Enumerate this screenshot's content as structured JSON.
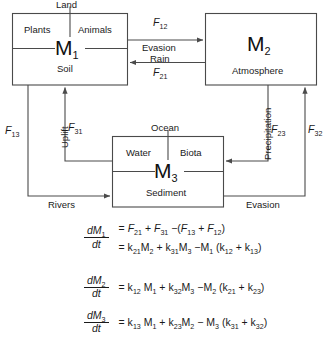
{
  "diagram": {
    "colors": {
      "stroke": "#4a4a4a",
      "text": "#1a1a1a",
      "background": "#ffffff"
    },
    "boxes": [
      {
        "id": "m1",
        "symbol": "M",
        "subscript": "1",
        "header": "Land",
        "upper_left": "Plants",
        "upper_right": "Animals",
        "lower": "Soil"
      },
      {
        "id": "m2",
        "symbol": "M",
        "subscript": "2",
        "header": "",
        "lower": "Atmosphere"
      },
      {
        "id": "m3",
        "symbol": "M",
        "subscript": "3",
        "header": "Ocean",
        "upper_left": "Water",
        "upper_right": "Biota",
        "lower": "Sediment"
      }
    ],
    "fluxes": [
      {
        "id": "f12",
        "symbol": "F",
        "subscript": "12",
        "process": "Evasion",
        "from": "m1",
        "to": "m2"
      },
      {
        "id": "f21",
        "symbol": "F",
        "subscript": "21",
        "process": "Rain",
        "from": "m2",
        "to": "m1"
      },
      {
        "id": "f13",
        "symbol": "F",
        "subscript": "13",
        "process": "Rivers",
        "from": "m1",
        "to": "m3"
      },
      {
        "id": "f31",
        "symbol": "F",
        "subscript": "31",
        "process": "Uplift",
        "from": "m3",
        "to": "m1"
      },
      {
        "id": "f23",
        "symbol": "F",
        "subscript": "23",
        "process": "Precipitation",
        "from": "m2",
        "to": "m3"
      },
      {
        "id": "f32",
        "symbol": "F",
        "subscript": "32",
        "process": "Evasion",
        "from": "m3",
        "to": "m2"
      }
    ]
  },
  "equations": [
    {
      "id": "eq-m1",
      "lhs_num": "dM",
      "lhs_num_sub": "1",
      "lhs_den": "dt",
      "lines": [
        "= F21 + F31 −(F13 + F12)",
        "= k21M2 + k31M3 −M1 (k12 + k13)"
      ]
    },
    {
      "id": "eq-m2",
      "lhs_num": "dM",
      "lhs_num_sub": "2",
      "lhs_den": "dt",
      "lines": [
        "= k12 M1 + k32M3 −M2 (k21 + k23)"
      ]
    },
    {
      "id": "eq-m3",
      "lhs_num": "dM",
      "lhs_num_sub": "3",
      "lhs_den": "dt",
      "lines": [
        "= k13 M1 + k23M2 − M3 (k31 + k32)"
      ]
    }
  ]
}
